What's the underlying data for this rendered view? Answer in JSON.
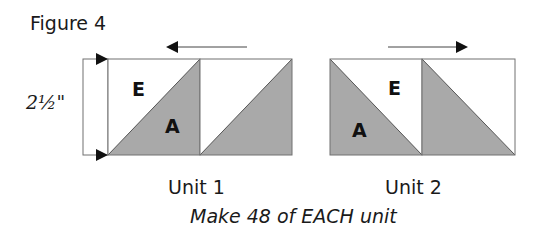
{
  "figure": {
    "title": "Figure 4",
    "dimension_label": "2½\"",
    "caption": "Make 48 of EACH unit",
    "colors": {
      "shaded": "#a9a9a9",
      "outline": "#707070",
      "arrow": "#111111",
      "background": "#ffffff"
    },
    "units": [
      {
        "label": "Unit 1",
        "pressing_arrow": "left",
        "squares": [
          {
            "diagonal": "bottom-left to top-right",
            "shaded": "lower-right",
            "pieces": [
              "E",
              "A"
            ]
          },
          {
            "diagonal": "bottom-left to top-right",
            "shaded": "lower-right",
            "pieces": []
          }
        ]
      },
      {
        "label": "Unit 2",
        "pressing_arrow": "right",
        "squares": [
          {
            "diagonal": "top-left to bottom-right",
            "shaded": "lower-left",
            "pieces": [
              "E",
              "A"
            ]
          },
          {
            "diagonal": "top-left to bottom-right",
            "shaded": "lower-left",
            "pieces": []
          }
        ]
      }
    ]
  }
}
